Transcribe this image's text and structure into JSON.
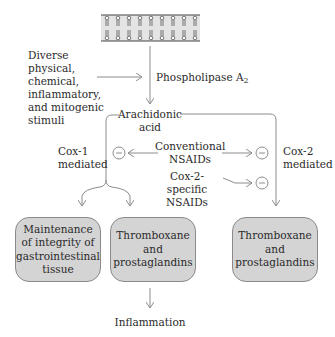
{
  "diagram": {
    "membrane": {
      "label": "cell-membrane-phospholipid-bilayer",
      "heads_per_row": 9
    },
    "stimuli_text": [
      "Diverse",
      "physical, chemical,",
      "inflammatory,",
      "and mitogenic",
      "stimuli"
    ],
    "enzyme": {
      "main": "Phospholipase A",
      "subscript": "2"
    },
    "substrate": [
      "Arachidonic",
      "acid"
    ],
    "left_pathway": [
      "Cox-1",
      "mediated"
    ],
    "right_pathway": [
      "Cox-2",
      "mediated"
    ],
    "inhibitors": {
      "conventional": [
        "Conventional",
        "NSAIDs"
      ],
      "cox2_specific": [
        "Cox-2-specific",
        "NSAIDs"
      ]
    },
    "inhibition_symbol": "−",
    "boxes": [
      {
        "lines": [
          "Maintenance",
          "of integrity of",
          "gastrointestinal",
          "tissue"
        ]
      },
      {
        "lines": [
          "Thromboxane",
          "and",
          "prostaglandins"
        ]
      },
      {
        "lines": [
          "Thromboxane",
          "and",
          "prostaglandins"
        ]
      }
    ],
    "outcome": "Inflammation",
    "colors": {
      "box_fill": "#d4d4d4",
      "box_border": "#8a8a8a",
      "line": "#8c8c8c",
      "membrane_fill": "#e4e4e4"
    }
  }
}
